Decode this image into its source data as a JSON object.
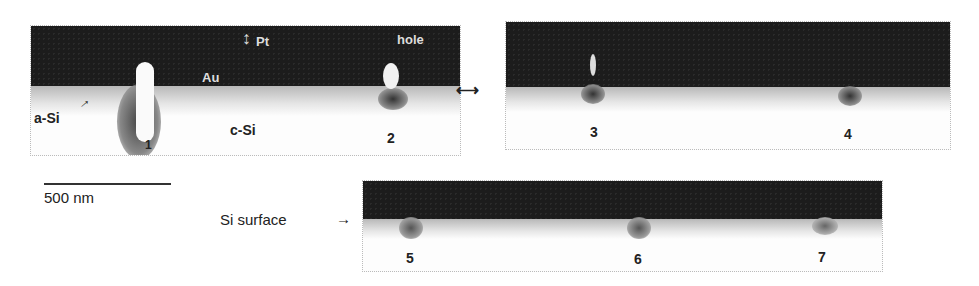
{
  "figure": {
    "panel_a": {
      "labels": {
        "pt": "Pt",
        "hole": "hole",
        "au": "Au",
        "asi": "a-Si",
        "csi": "c-Si",
        "n1": "1",
        "n2": "2"
      }
    },
    "panel_b": {
      "labels": {
        "n3": "3",
        "n4": "4"
      }
    },
    "panel_c": {
      "labels": {
        "n5": "5",
        "n6": "6",
        "n7": "7"
      }
    },
    "scale_bar": {
      "label": "500 nm"
    },
    "si_surface_label": "Si surface",
    "colors": {
      "pt_layer": "#1c1c1c",
      "substrate": "#fdfdfd",
      "damage": "#555555"
    }
  }
}
